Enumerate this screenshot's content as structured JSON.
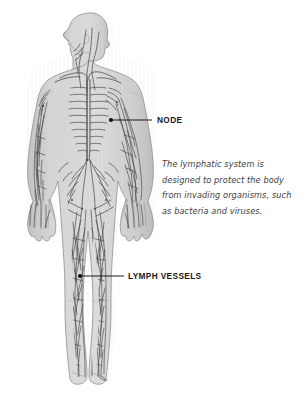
{
  "diagram": {
    "view": "anterior full-body figure with head in left profile",
    "background_color": "#ffffff",
    "body_fill_color": "#d2d2d2",
    "body_outline_color": "#8f8f8f",
    "vessel_color": "#4a4a4a",
    "node_color": "#1a1a1a",
    "leader_color": "#1a1a1a"
  },
  "callouts": [
    {
      "id": "node",
      "label": "NODE",
      "marker_x": 111,
      "marker_y": 120,
      "leader_end_x": 152,
      "leader_end_y": 120
    },
    {
      "id": "lymph-vessels",
      "label": "LYMPH VESSELS",
      "marker_x": 80,
      "marker_y": 276,
      "leader_end_x": 124,
      "leader_end_y": 276
    }
  ],
  "description": {
    "lines": [
      "The lymphatic system is",
      "designed to protect the body",
      "from invading organisms, such",
      "as bacteria and viruses."
    ],
    "full_text": "The lymphatic system is designed to protect the body from invading organisms, such as bacteria and viruses."
  }
}
